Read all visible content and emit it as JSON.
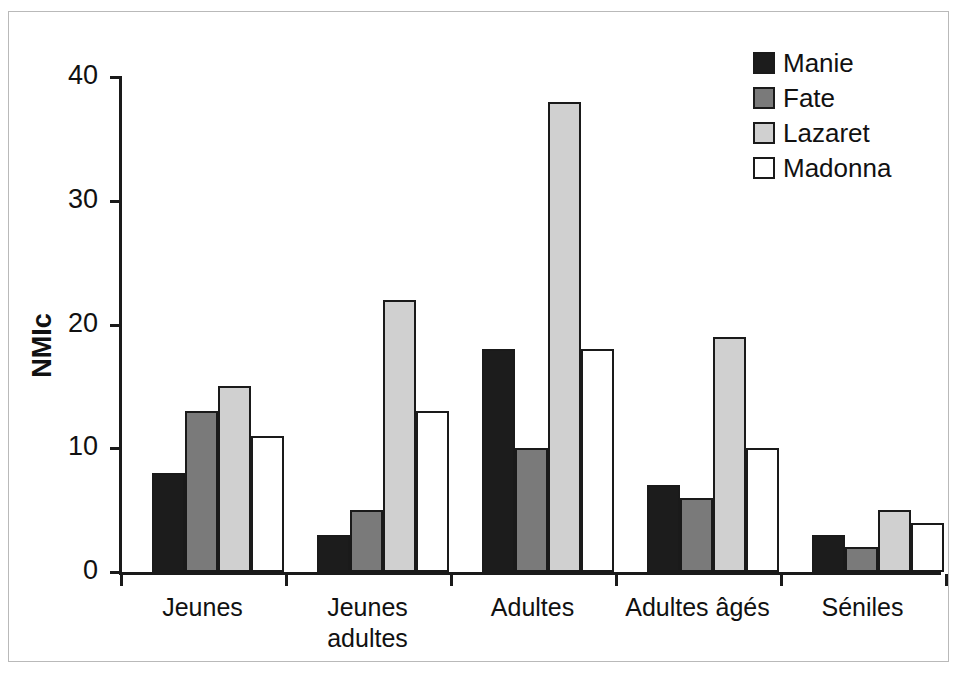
{
  "chart_data": {
    "type": "bar",
    "title": "",
    "subtitle": "",
    "xlabel": "",
    "ylabel": "NMIc",
    "ylim": [
      0,
      40
    ],
    "ytick_labels": [
      "0",
      "10",
      "20",
      "30",
      "40"
    ],
    "yticks": [
      0,
      10,
      20,
      30,
      40
    ],
    "grid": false,
    "legend_position": "top-right",
    "categories": [
      "Jeunes",
      "Jeunes\nadultes",
      "Adultes",
      "Adultes âgés",
      "Séniles"
    ],
    "series": [
      {
        "name": "Manie",
        "color": "#1c1c1c",
        "values": [
          8,
          3,
          18,
          7,
          3
        ]
      },
      {
        "name": "Fate",
        "color": "#7a7a7a",
        "values": [
          13,
          5,
          10,
          6,
          2
        ]
      },
      {
        "name": "Lazaret",
        "color": "#d0d0d0",
        "values": [
          15,
          22,
          38,
          19,
          5
        ]
      },
      {
        "name": "Madonna",
        "color": "#ffffff",
        "values": [
          11,
          13,
          18,
          10,
          4
        ]
      }
    ]
  },
  "legend": {
    "items": [
      {
        "label": "Manie"
      },
      {
        "label": "Fate"
      },
      {
        "label": "Lazaret"
      },
      {
        "label": "Madonna"
      }
    ]
  },
  "axis": {
    "y_title": "NMIc"
  }
}
